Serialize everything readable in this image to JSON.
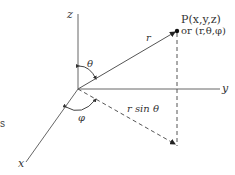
{
  "diagram": {
    "colors": {
      "line": "#555555",
      "text": "#333333",
      "background": "#ffffff"
    },
    "axes": {
      "z_label": "z",
      "y_label": "y",
      "x_label": "x"
    },
    "point": {
      "label_line1": "P(x,y,z)",
      "label_line2": "or (r,θ,φ)"
    },
    "labels": {
      "radius": "r",
      "theta": "θ",
      "phi": "φ",
      "projection": "r sin θ"
    },
    "edge_fragment": "s"
  }
}
